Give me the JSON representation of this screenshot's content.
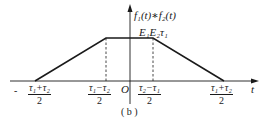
{
  "figure": {
    "caption": "( b )",
    "y_axis_label": "f₁(t)∗f₂(t)",
    "x_axis_label": "t",
    "origin_label": "O",
    "plateau_label": "E₁E₂τ₁",
    "ticks": [
      {
        "sign": "-",
        "numerator": "τ₁+τ₂",
        "denominator": "2"
      },
      {
        "sign": "",
        "numerator": "τ₁−τ₂",
        "denominator": "2"
      },
      {
        "sign": "",
        "numerator": "τ₂−τ₁",
        "denominator": "2"
      },
      {
        "sign": "",
        "numerator": "τ₁+τ₂",
        "denominator": "2"
      }
    ],
    "shape": "trapezoid",
    "colors": {
      "line": "#1a1a1a",
      "background": "#ffffff"
    }
  }
}
